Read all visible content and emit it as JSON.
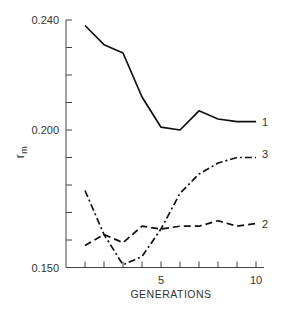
{
  "chart_data": {
    "type": "line",
    "title": "",
    "xlabel": "GENERATIONS",
    "ylabel": "r_m",
    "ylabel_main": "r",
    "ylabel_sub": "m",
    "x": [
      1,
      2,
      3,
      4,
      5,
      6,
      7,
      8,
      9,
      10
    ],
    "xlim": [
      1,
      10
    ],
    "ylim": [
      0.15,
      0.24
    ],
    "x_tick_labels": [
      {
        "value": 5,
        "label": "5"
      },
      {
        "value": 10,
        "label": "10"
      }
    ],
    "y_tick_labels": [
      {
        "value": 0.24,
        "label": "0.240"
      },
      {
        "value": 0.2,
        "label": "0.200"
      },
      {
        "value": 0.15,
        "label": "0.150"
      }
    ],
    "y_minor_ticks": [
      0.15,
      0.16,
      0.17,
      0.18,
      0.19,
      0.2,
      0.21,
      0.22,
      0.23,
      0.24
    ],
    "grid": false,
    "legend_position": "inline labels at right end of each line",
    "series": [
      {
        "name": "1",
        "style": "solid",
        "values": [
          0.238,
          0.231,
          0.228,
          0.212,
          0.201,
          0.2,
          0.207,
          0.204,
          0.203,
          0.203
        ]
      },
      {
        "name": "2",
        "style": "dashed",
        "values": [
          0.158,
          0.162,
          0.159,
          0.165,
          0.164,
          0.165,
          0.165,
          0.167,
          0.165,
          0.166
        ]
      },
      {
        "name": "3",
        "style": "dash-dot",
        "values": [
          0.178,
          0.162,
          0.151,
          0.154,
          0.164,
          0.177,
          0.184,
          0.188,
          0.19,
          0.19
        ]
      }
    ],
    "color": "#111111"
  }
}
